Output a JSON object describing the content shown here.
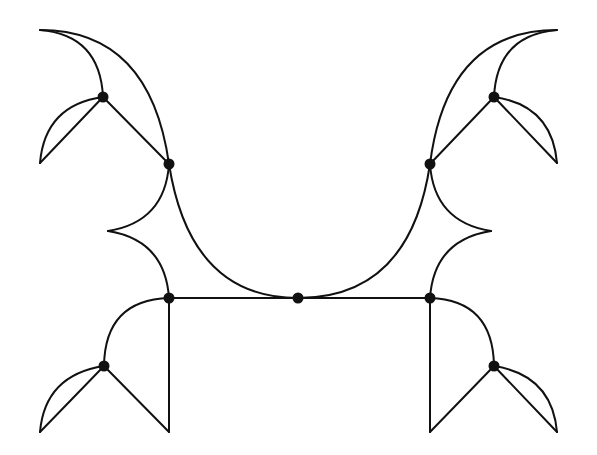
{
  "diagram": {
    "type": "graph-with-curved-edges",
    "symmetry": "bilateral (left-right mirror)",
    "colors": {
      "stroke": "#111111",
      "vertex": "#111111",
      "background": "#ffffff"
    },
    "vertices": [
      {
        "id": "A_left",
        "x": 103,
        "y": 97
      },
      {
        "id": "B_left",
        "x": 169,
        "y": 164
      },
      {
        "id": "C_left",
        "x": 169,
        "y": 298
      },
      {
        "id": "D_center",
        "x": 298,
        "y": 298
      },
      {
        "id": "C_right",
        "x": 430,
        "y": 298
      },
      {
        "id": "B_right",
        "x": 430,
        "y": 164
      },
      {
        "id": "A_right",
        "x": 494,
        "y": 97
      },
      {
        "id": "E_left",
        "x": 104,
        "y": 366
      },
      {
        "id": "E_right",
        "x": 494,
        "y": 366
      }
    ],
    "edges": [
      {
        "name": "top-left-outer-arc",
        "d": "M40,30 Q150,30 169,164"
      },
      {
        "name": "top-left-inner-arc",
        "d": "M40,30 Q100,35 103,97"
      },
      {
        "name": "top-left-spoke",
        "d": "M103,97 L169,164"
      },
      {
        "name": "top-left-lobe-arc",
        "d": "M103,97 Q45,105 40,163"
      },
      {
        "name": "top-left-lobe-line",
        "d": "M103,97 L40,163"
      },
      {
        "name": "left-cusp-upper",
        "d": "M169,164 Q165,222 108,231"
      },
      {
        "name": "left-cusp-lower",
        "d": "M108,231 Q165,240 169,298"
      },
      {
        "name": "central-u-arc",
        "d": "M169,164 Q190,298 298,298 Q410,298 430,164"
      },
      {
        "name": "bottom-bar",
        "d": "M169,298 L430,298"
      },
      {
        "name": "left-upright",
        "d": "M169,298 L169,432"
      },
      {
        "name": "bottom-left-quarter-arc",
        "d": "M169,298 Q105,300 104,366"
      },
      {
        "name": "bottom-left-spoke-right",
        "d": "M104,366 L169,432"
      },
      {
        "name": "bottom-left-lobe-arc",
        "d": "M104,366 Q45,375 40,432"
      },
      {
        "name": "bottom-left-lobe-line",
        "d": "M104,366 L40,432"
      },
      {
        "name": "top-right-outer-arc",
        "d": "M557,30 Q447,30 430,164"
      },
      {
        "name": "top-right-inner-arc",
        "d": "M557,30 Q497,35 494,97"
      },
      {
        "name": "top-right-spoke",
        "d": "M494,97 L430,164"
      },
      {
        "name": "top-right-lobe-arc",
        "d": "M494,97 Q552,105 557,163"
      },
      {
        "name": "top-right-lobe-line",
        "d": "M494,97 L557,163"
      },
      {
        "name": "right-cusp-upper",
        "d": "M430,164 Q434,222 491,231"
      },
      {
        "name": "right-cusp-lower",
        "d": "M491,231 Q434,240 430,298"
      },
      {
        "name": "right-upright",
        "d": "M430,298 L430,432"
      },
      {
        "name": "bottom-right-quarter-arc",
        "d": "M430,298 Q493,300 494,366"
      },
      {
        "name": "bottom-right-spoke-left",
        "d": "M494,366 L430,432"
      },
      {
        "name": "bottom-right-lobe-arc",
        "d": "M494,366 Q552,375 557,432"
      },
      {
        "name": "bottom-right-lobe-line",
        "d": "M494,366 L557,432"
      }
    ]
  }
}
